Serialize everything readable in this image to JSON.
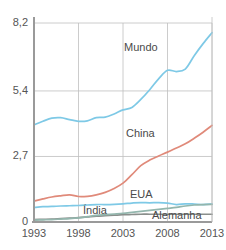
{
  "chart_data": {
    "type": "line",
    "title": "",
    "subtitle": "",
    "xlabel": "",
    "ylabel": "",
    "xlim": [
      1993,
      2013
    ],
    "ylim": [
      0,
      8.2
    ],
    "grid": true,
    "legend_position": "inline-labels",
    "x_ticks": [
      "1993",
      "1998",
      "2003",
      "2008",
      "2013"
    ],
    "x_tick_values": [
      1993,
      1998,
      2003,
      2008,
      2013
    ],
    "y_ticks": [
      "0",
      "2,7",
      "5,4",
      "8,2"
    ],
    "y_tick_values": [
      0,
      2.7,
      5.4,
      8.2
    ],
    "x": [
      1993,
      1994,
      1995,
      1996,
      1997,
      1998,
      1999,
      2000,
      2001,
      2002,
      2003,
      2004,
      2005,
      2006,
      2007,
      2008,
      2009,
      2010,
      2011,
      2012,
      2013
    ],
    "series": [
      {
        "name": "Mundo",
        "color": "#7ec9e6",
        "values": [
          4.0,
          4.15,
          4.28,
          4.3,
          4.22,
          4.15,
          4.17,
          4.3,
          4.32,
          4.45,
          4.62,
          4.72,
          5.05,
          5.45,
          5.9,
          6.25,
          6.2,
          6.3,
          6.85,
          7.35,
          7.8
        ]
      },
      {
        "name": "China",
        "color": "#e08a7a",
        "values": [
          0.86,
          0.95,
          1.03,
          1.08,
          1.12,
          1.05,
          1.06,
          1.12,
          1.22,
          1.38,
          1.6,
          1.95,
          2.32,
          2.55,
          2.72,
          2.88,
          3.05,
          3.22,
          3.45,
          3.7,
          3.98
        ]
      },
      {
        "name": "EUA",
        "color": "#7ec9e6",
        "values": [
          0.6,
          0.63,
          0.64,
          0.66,
          0.67,
          0.68,
          0.7,
          0.72,
          0.72,
          0.73,
          0.75,
          0.78,
          0.8,
          0.79,
          0.8,
          0.78,
          0.72,
          0.75,
          0.74,
          0.72,
          0.74
        ]
      },
      {
        "name": "Índia",
        "color": "#8a8f8c",
        "values": [
          0.1,
          0.11,
          0.12,
          0.14,
          0.16,
          0.18,
          0.21,
          0.24,
          0.26,
          0.28,
          0.3,
          0.31,
          0.32,
          0.32,
          0.32,
          0.32,
          0.32,
          0.32,
          0.32,
          0.32,
          0.32
        ]
      },
      {
        "name": "Alemanha",
        "color": "#93b6ad",
        "values": [
          0.08,
          0.09,
          0.1,
          0.12,
          0.14,
          0.17,
          0.22,
          0.27,
          0.3,
          0.33,
          0.36,
          0.4,
          0.44,
          0.48,
          0.52,
          0.56,
          0.6,
          0.66,
          0.7,
          0.72,
          0.73
        ]
      }
    ],
    "series_labels": [
      {
        "text": "Mundo",
        "x_px": 124,
        "y_px": 41
      },
      {
        "text": "China",
        "x_px": 126,
        "y_px": 127
      },
      {
        "text": "EUA",
        "x_px": 130,
        "y_px": 188
      },
      {
        "text": "Índia",
        "x_px": 83,
        "y_px": 204
      },
      {
        "text": "Alemanha",
        "x_px": 152,
        "y_px": 209
      }
    ],
    "axis_color": "#9a9a9a",
    "grid_color": "#bfbfbf",
    "background": "#ffffff"
  }
}
